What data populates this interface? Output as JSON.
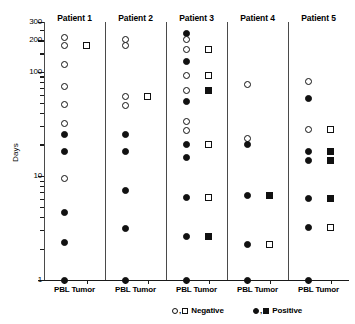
{
  "chart_data": {
    "type": "scatter",
    "title": "",
    "xlabel": "",
    "ylabel": "Days",
    "yscale": "log",
    "ylim": [
      1,
      300
    ],
    "grid": false,
    "legend_position": "bottom",
    "y_tick_labels": [
      "300",
      "200",
      "100",
      "10",
      "1"
    ],
    "y_tick_values": [
      300,
      200,
      100,
      10,
      1
    ],
    "legend": [
      {
        "symbols": "O,□",
        "label": "Negative",
        "marker_style": "open"
      },
      {
        "symbols": "●,■",
        "label": "Positive",
        "marker_style": "filled"
      }
    ],
    "legend_text": {
      "negative_symbols": "O,□",
      "negative_label": "Negative",
      "positive_symbols": "●,■",
      "positive_label": "Positive"
    },
    "category_labels": [
      "PBL",
      "Tumor"
    ],
    "panels": [
      {
        "title": "Patient 1",
        "groups": [
          {
            "name": "PBL",
            "marker_shape": "circle",
            "points": [
              {
                "days": 215,
                "status": "Negative",
                "fill": "open"
              },
              {
                "days": 180,
                "status": "Negative",
                "fill": "open"
              },
              {
                "days": 117,
                "status": "Negative",
                "fill": "open"
              },
              {
                "days": 72,
                "status": "Negative",
                "fill": "open"
              },
              {
                "days": 48,
                "status": "Negative",
                "fill": "open"
              },
              {
                "days": 32,
                "status": "Negative",
                "fill": "open"
              },
              {
                "days": 25,
                "status": "Positive",
                "fill": "filled"
              },
              {
                "days": 17,
                "status": "Positive",
                "fill": "filled"
              },
              {
                "days": 9.5,
                "status": "Negative",
                "fill": "open"
              },
              {
                "days": 4.4,
                "status": "Positive",
                "fill": "filled"
              },
              {
                "days": 2.3,
                "status": "Positive",
                "fill": "filled"
              },
              {
                "days": 1,
                "status": "Positive",
                "fill": "filled"
              }
            ]
          },
          {
            "name": "Tumor",
            "marker_shape": "square",
            "points": [
              {
                "days": 180,
                "status": "Negative",
                "fill": "open"
              }
            ]
          }
        ]
      },
      {
        "title": "Patient 2",
        "groups": [
          {
            "name": "PBL",
            "marker_shape": "circle",
            "points": [
              {
                "days": 205,
                "status": "Negative",
                "fill": "open"
              },
              {
                "days": 178,
                "status": "Negative",
                "fill": "open"
              },
              {
                "days": 58,
                "status": "Negative",
                "fill": "open"
              },
              {
                "days": 47,
                "status": "Negative",
                "fill": "open"
              },
              {
                "days": 25,
                "status": "Positive",
                "fill": "filled"
              },
              {
                "days": 17,
                "status": "Positive",
                "fill": "filled"
              },
              {
                "days": 7.3,
                "status": "Positive",
                "fill": "filled"
              },
              {
                "days": 3.1,
                "status": "Positive",
                "fill": "filled"
              },
              {
                "days": 1,
                "status": "Positive",
                "fill": "filled"
              }
            ]
          },
          {
            "name": "Tumor",
            "marker_shape": "square",
            "points": [
              {
                "days": 58,
                "status": "Negative",
                "fill": "open"
              }
            ]
          }
        ]
      },
      {
        "title": "Patient 3",
        "groups": [
          {
            "name": "PBL",
            "marker_shape": "circle",
            "points": [
              {
                "days": 232,
                "status": "Positive",
                "fill": "filled"
              },
              {
                "days": 205,
                "status": "Negative",
                "fill": "open"
              },
              {
                "days": 165,
                "status": "Negative",
                "fill": "open"
              },
              {
                "days": 125,
                "status": "Positive",
                "fill": "filled"
              },
              {
                "days": 92,
                "status": "Negative",
                "fill": "open"
              },
              {
                "days": 66,
                "status": "Negative",
                "fill": "open"
              },
              {
                "days": 52,
                "status": "Positive",
                "fill": "filled"
              },
              {
                "days": 33,
                "status": "Negative",
                "fill": "open"
              },
              {
                "days": 27,
                "status": "Negative",
                "fill": "open"
              },
              {
                "days": 20,
                "status": "Positive",
                "fill": "filled"
              },
              {
                "days": 15,
                "status": "Positive",
                "fill": "filled"
              },
              {
                "days": 6.2,
                "status": "Positive",
                "fill": "filled"
              },
              {
                "days": 2.6,
                "status": "Positive",
                "fill": "filled"
              },
              {
                "days": 1,
                "status": "Positive",
                "fill": "filled"
              }
            ]
          },
          {
            "name": "Tumor",
            "marker_shape": "square",
            "points": [
              {
                "days": 165,
                "status": "Negative",
                "fill": "open"
              },
              {
                "days": 92,
                "status": "Negative",
                "fill": "open"
              },
              {
                "days": 66,
                "status": "Positive",
                "fill": "filled"
              },
              {
                "days": 20,
                "status": "Negative",
                "fill": "open"
              },
              {
                "days": 6.2,
                "status": "Negative",
                "fill": "open"
              },
              {
                "days": 2.6,
                "status": "Positive",
                "fill": "filled"
              }
            ]
          }
        ]
      },
      {
        "title": "Patient 4",
        "groups": [
          {
            "name": "PBL",
            "marker_shape": "circle",
            "points": [
              {
                "days": 75,
                "status": "Negative",
                "fill": "open"
              },
              {
                "days": 23,
                "status": "Negative",
                "fill": "open"
              },
              {
                "days": 20,
                "status": "Positive",
                "fill": "filled"
              },
              {
                "days": 6.5,
                "status": "Positive",
                "fill": "filled"
              },
              {
                "days": 2.2,
                "status": "Positive",
                "fill": "filled"
              },
              {
                "days": 1,
                "status": "Positive",
                "fill": "filled"
              }
            ]
          },
          {
            "name": "Tumor",
            "marker_shape": "square",
            "points": [
              {
                "days": 6.5,
                "status": "Positive",
                "fill": "filled"
              },
              {
                "days": 2.2,
                "status": "Negative",
                "fill": "open"
              }
            ]
          }
        ]
      },
      {
        "title": "Patient 5",
        "groups": [
          {
            "name": "PBL",
            "marker_shape": "circle",
            "points": [
              {
                "days": 80,
                "status": "Negative",
                "fill": "open"
              },
              {
                "days": 55,
                "status": "Positive",
                "fill": "filled"
              },
              {
                "days": 28,
                "status": "Negative",
                "fill": "open"
              },
              {
                "days": 17,
                "status": "Positive",
                "fill": "filled"
              },
              {
                "days": 14,
                "status": "Positive",
                "fill": "filled"
              },
              {
                "days": 6.0,
                "status": "Positive",
                "fill": "filled"
              },
              {
                "days": 3.2,
                "status": "Positive",
                "fill": "filled"
              },
              {
                "days": 1,
                "status": "Positive",
                "fill": "filled"
              }
            ]
          },
          {
            "name": "Tumor",
            "marker_shape": "square",
            "points": [
              {
                "days": 28,
                "status": "Negative",
                "fill": "open"
              },
              {
                "days": 17,
                "status": "Positive",
                "fill": "filled"
              },
              {
                "days": 14,
                "status": "Positive",
                "fill": "filled"
              },
              {
                "days": 6.0,
                "status": "Positive",
                "fill": "filled"
              },
              {
                "days": 3.2,
                "status": "Negative",
                "fill": "open"
              }
            ]
          }
        ]
      }
    ]
  }
}
